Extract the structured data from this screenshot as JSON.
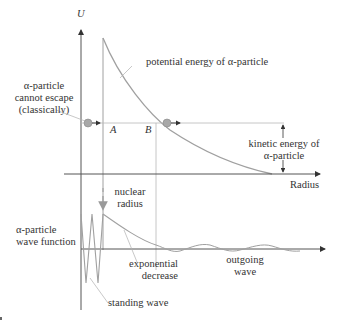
{
  "diagram": {
    "type": "alpha-decay-tunneling",
    "colors": {
      "axis": "#555555",
      "curve": "#a0a0a0",
      "guide": "#b8b8b8",
      "particle": "#9a9a9a",
      "text": "#333333"
    },
    "top_plot": {
      "y_axis_label": "U",
      "x_axis_label": "Radius",
      "curve_label": "potential energy of α-particle",
      "point_a": "A",
      "point_b": "B",
      "left_annotation": [
        "α-particle",
        "cannot escape",
        "(classically)"
      ],
      "right_annotation": [
        "kinetic energy of",
        "α-particle"
      ]
    },
    "middle": {
      "nuclear_radius_label": [
        "nuclear",
        "radius"
      ]
    },
    "bottom_plot": {
      "y_label": [
        "α-particle",
        "wave function"
      ],
      "exponential_label": [
        "exponential",
        "decrease"
      ],
      "outgoing_label": [
        "outgoing",
        "wave"
      ],
      "standing_label": "standing wave"
    }
  }
}
